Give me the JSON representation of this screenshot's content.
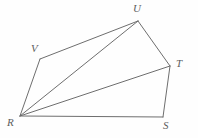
{
  "figure": {
    "name": "polygon-rstuv-with-diagonals",
    "canvas": {
      "width": 198,
      "height": 138
    },
    "background_color": "#fefefe",
    "line_color": "#6e6e6e",
    "label_color": "#5d5d5d",
    "line_width": 1,
    "vertices": [
      {
        "id": "R",
        "label": "R",
        "x": 20,
        "y": 116,
        "label_x": 7,
        "label_y": 117
      },
      {
        "id": "V",
        "label": "V",
        "x": 40,
        "y": 59,
        "label_x": 31,
        "label_y": 43
      },
      {
        "id": "U",
        "label": "U",
        "x": 138,
        "y": 21,
        "label_x": 133,
        "label_y": 3
      },
      {
        "id": "T",
        "label": "T",
        "x": 170,
        "y": 66,
        "label_x": 176,
        "label_y": 58
      },
      {
        "id": "S",
        "label": "S",
        "x": 163,
        "y": 117,
        "label_x": 163,
        "label_y": 120
      }
    ],
    "edges": [
      {
        "id": "edge-RV",
        "from": "R",
        "to": "V",
        "x1": 20,
        "y1": 116,
        "x2": 40,
        "y2": 59
      },
      {
        "id": "edge-VU",
        "from": "V",
        "to": "U",
        "x1": 40,
        "y1": 59,
        "x2": 138,
        "y2": 21
      },
      {
        "id": "edge-UT",
        "from": "U",
        "to": "T",
        "x1": 138,
        "y1": 21,
        "x2": 170,
        "y2": 66
      },
      {
        "id": "edge-TS",
        "from": "T",
        "to": "S",
        "x1": 170,
        "y1": 66,
        "x2": 163,
        "y2": 117
      },
      {
        "id": "edge-SR",
        "from": "S",
        "to": "R",
        "x1": 163,
        "y1": 117,
        "x2": 20,
        "y2": 116
      },
      {
        "id": "edge-RU",
        "from": "R",
        "to": "U",
        "x1": 20,
        "y1": 116,
        "x2": 138,
        "y2": 21
      },
      {
        "id": "edge-RT",
        "from": "R",
        "to": "T",
        "x1": 20,
        "y1": 116,
        "x2": 170,
        "y2": 66
      }
    ]
  }
}
